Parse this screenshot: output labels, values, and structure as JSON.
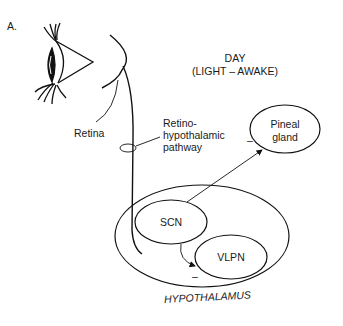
{
  "figure": {
    "panel_label": "A.",
    "condition": {
      "title": "DAY",
      "subtitle": "(LIGHT – AWAKE)"
    },
    "labels": {
      "retina": "Retina",
      "pathway_line1": "Retino-",
      "pathway_line2": "hypothalamic",
      "pathway_line3": "pathway",
      "pineal_line1": "Pineal",
      "pineal_line2": "gland",
      "scn": "SCN",
      "vlpn": "VLPN",
      "hypothalamus": "HYPOTHALAMUS"
    },
    "signs": {
      "pineal_inhibition": "–",
      "vlpn_inhibition": "–"
    },
    "colors": {
      "stroke": "#111111",
      "background": "#ffffff"
    }
  }
}
